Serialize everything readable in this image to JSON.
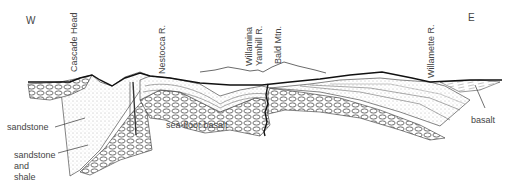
{
  "diagram": {
    "type": "geologic-cross-section",
    "orientation": {
      "west": "W",
      "east": "E"
    },
    "place_labels": [
      {
        "id": "cascade-head",
        "text": "Cascade Head"
      },
      {
        "id": "nestocca-r",
        "text": "Nestocca R."
      },
      {
        "id": "willamina",
        "text": "Willamina"
      },
      {
        "id": "yamhill-r",
        "text": "Yamhill R."
      },
      {
        "id": "bald-mtn",
        "text": "Bald Mtn."
      },
      {
        "id": "willamette-r",
        "text": "Willamette R."
      }
    ],
    "unit_labels": [
      {
        "id": "sandstone",
        "text": "sandstone"
      },
      {
        "id": "sandstone-and-shale",
        "lines": [
          "sandstone",
          "and",
          "shale"
        ]
      },
      {
        "id": "sea-floor-basalt",
        "text": "sea-floor basalt"
      },
      {
        "id": "basalt",
        "text": "basalt"
      }
    ],
    "colors": {
      "line": "#222222",
      "fill": "#ffffff",
      "stipple": "#888888"
    }
  }
}
